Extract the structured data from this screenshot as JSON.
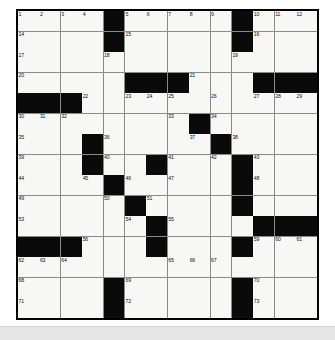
{
  "puzzle": {
    "name": "crossword-grid",
    "columns": 14,
    "rows": 15,
    "colors": {
      "block": "#0a0a0a",
      "cell": "#f7f7f5",
      "grid_line": "#8a8a8a",
      "border": "#000000",
      "page_background": "#ffffff",
      "footer_band": "#e6e6e6"
    },
    "layout": {
      "legend": "'.' = open (white) square, '#' = blocked (black) square",
      "rows": [
        "....#.....#....",
        "....#.....#....",
        "..............",
        ".....###...####",
        "###...........",
        "........#.....",
        "...#.....#....",
        "...#..#...#...",
        "....#.....#...",
        ".....#....#...",
        "......#....###",
        "###...#...#...",
        "..............",
        "....#.....#...",
        "....#.....#..."
      ]
    },
    "numbers": [
      {
        "label": "1",
        "row": 0,
        "col": 0
      },
      {
        "label": "2",
        "row": 0,
        "col": 1
      },
      {
        "label": "3",
        "row": 0,
        "col": 2
      },
      {
        "label": "4",
        "row": 0,
        "col": 3
      },
      {
        "label": "5",
        "row": 0,
        "col": 5
      },
      {
        "label": "6",
        "row": 0,
        "col": 6
      },
      {
        "label": "7",
        "row": 0,
        "col": 7
      },
      {
        "label": "8",
        "row": 0,
        "col": 8
      },
      {
        "label": "9",
        "row": 0,
        "col": 9
      },
      {
        "label": "10",
        "row": 0,
        "col": 11
      },
      {
        "label": "11",
        "row": 0,
        "col": 12
      },
      {
        "label": "12",
        "row": 0,
        "col": 13
      },
      {
        "label": "13",
        "row": 0,
        "col": 14
      },
      {
        "label": "14",
        "row": 1,
        "col": 0
      },
      {
        "label": "15",
        "row": 1,
        "col": 5
      },
      {
        "label": "16",
        "row": 1,
        "col": 11
      },
      {
        "label": "17",
        "row": 2,
        "col": 0
      },
      {
        "label": "18",
        "row": 2,
        "col": 4
      },
      {
        "label": "19",
        "row": 2,
        "col": 10
      },
      {
        "label": "20",
        "row": 3,
        "col": 0
      },
      {
        "label": "21",
        "row": 3,
        "col": 8
      },
      {
        "label": "22",
        "row": 4,
        "col": 3
      },
      {
        "label": "23",
        "row": 4,
        "col": 5
      },
      {
        "label": "24",
        "row": 4,
        "col": 6
      },
      {
        "label": "25",
        "row": 4,
        "col": 7
      },
      {
        "label": "26",
        "row": 4,
        "col": 9
      },
      {
        "label": "27",
        "row": 4,
        "col": 11
      },
      {
        "label": "28",
        "row": 4,
        "col": 12
      },
      {
        "label": "29",
        "row": 4,
        "col": 13
      },
      {
        "label": "30",
        "row": 5,
        "col": 0
      },
      {
        "label": "31",
        "row": 5,
        "col": 1
      },
      {
        "label": "32",
        "row": 5,
        "col": 2
      },
      {
        "label": "33",
        "row": 5,
        "col": 7
      },
      {
        "label": "34",
        "row": 5,
        "col": 9
      },
      {
        "label": "35",
        "row": 6,
        "col": 0
      },
      {
        "label": "36",
        "row": 6,
        "col": 4
      },
      {
        "label": "37",
        "row": 6,
        "col": 8
      },
      {
        "label": "38",
        "row": 6,
        "col": 10
      },
      {
        "label": "39",
        "row": 7,
        "col": 0
      },
      {
        "label": "40",
        "row": 7,
        "col": 4
      },
      {
        "label": "41",
        "row": 7,
        "col": 7
      },
      {
        "label": "42",
        "row": 7,
        "col": 9
      },
      {
        "label": "43",
        "row": 7,
        "col": 11
      },
      {
        "label": "44",
        "row": 8,
        "col": 0
      },
      {
        "label": "45",
        "row": 8,
        "col": 3
      },
      {
        "label": "46",
        "row": 8,
        "col": 5
      },
      {
        "label": "47",
        "row": 8,
        "col": 7
      },
      {
        "label": "48",
        "row": 8,
        "col": 11
      },
      {
        "label": "49",
        "row": 9,
        "col": 0
      },
      {
        "label": "50",
        "row": 9,
        "col": 4
      },
      {
        "label": "51",
        "row": 9,
        "col": 6
      },
      {
        "label": "52",
        "row": 9,
        "col": 10
      },
      {
        "label": "53",
        "row": 10,
        "col": 0
      },
      {
        "label": "54",
        "row": 10,
        "col": 5
      },
      {
        "label": "55",
        "row": 10,
        "col": 7
      },
      {
        "label": "56",
        "row": 11,
        "col": 3
      },
      {
        "label": "57",
        "row": 11,
        "col": 6
      },
      {
        "label": "58",
        "row": 11,
        "col": 10
      },
      {
        "label": "59",
        "row": 11,
        "col": 11
      },
      {
        "label": "60",
        "row": 11,
        "col": 12
      },
      {
        "label": "61",
        "row": 11,
        "col": 13
      },
      {
        "label": "62",
        "row": 12,
        "col": 0
      },
      {
        "label": "63",
        "row": 12,
        "col": 1
      },
      {
        "label": "64",
        "row": 12,
        "col": 2
      },
      {
        "label": "65",
        "row": 12,
        "col": 7
      },
      {
        "label": "66",
        "row": 12,
        "col": 8
      },
      {
        "label": "67",
        "row": 12,
        "col": 9
      },
      {
        "label": "68",
        "row": 13,
        "col": 0
      },
      {
        "label": "69",
        "row": 13,
        "col": 5
      },
      {
        "label": "70",
        "row": 13,
        "col": 11
      },
      {
        "label": "71",
        "row": 14,
        "col": 0
      },
      {
        "label": "72",
        "row": 14,
        "col": 5
      },
      {
        "label": "73",
        "row": 14,
        "col": 11
      }
    ]
  }
}
